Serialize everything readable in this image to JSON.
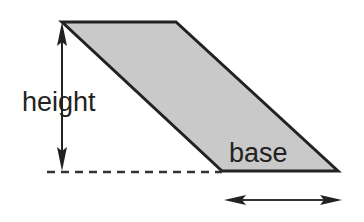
{
  "diagram": {
    "shape": "parallelogram",
    "labels": {
      "height": "height",
      "base": "base"
    },
    "colors": {
      "fill": "#c9c9c9",
      "stroke": "#222222",
      "background": "#ffffff"
    },
    "vertices": {
      "top_left": [
        62,
        22
      ],
      "top_right": [
        176,
        22
      ],
      "bottom_right": [
        338,
        171
      ],
      "bottom_left": [
        222,
        171
      ]
    }
  }
}
